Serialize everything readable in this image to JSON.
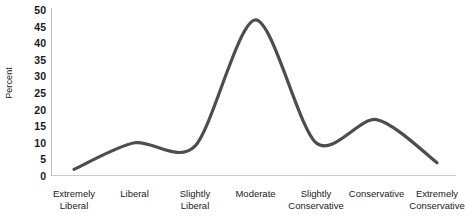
{
  "chart_data": {
    "type": "line",
    "title": "",
    "xlabel": "",
    "ylabel": "Percent",
    "ylim": [
      0,
      50
    ],
    "ytick_step": 5,
    "grid": false,
    "legend": false,
    "line_color": "#4d4d4d",
    "axis_color": "#9a9a9a",
    "text_color": "#1a1a1a",
    "smoothing": "spline",
    "categories": [
      "Extremely Liberal",
      "Liberal",
      "Slightly Liberal",
      "Moderate",
      "Slightly Conservative",
      "Conservative",
      "Extremely Conservative"
    ],
    "category_lines": [
      [
        "Extremely",
        "Liberal"
      ],
      [
        "Liberal",
        ""
      ],
      [
        "Slightly",
        "Liberal"
      ],
      [
        "Moderate",
        ""
      ],
      [
        "Slightly",
        "Conservative"
      ],
      [
        "Conservative",
        ""
      ],
      [
        "Extremely",
        "Conservative"
      ]
    ],
    "values": [
      2,
      10,
      9,
      47,
      10,
      17,
      4
    ],
    "yticks": [
      "0",
      "5",
      "10",
      "15",
      "20",
      "25",
      "30",
      "35",
      "40",
      "45",
      "50"
    ],
    "ytick_values": [
      0,
      5,
      10,
      15,
      20,
      25,
      30,
      35,
      40,
      45,
      50
    ]
  }
}
